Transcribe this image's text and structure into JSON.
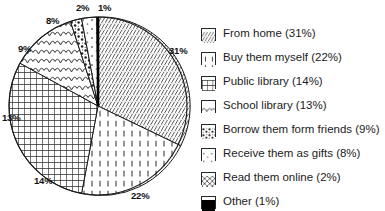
{
  "chart_data": {
    "type": "pie",
    "title": "",
    "xlabel": "",
    "ylabel": "",
    "legend_position": "right",
    "grid": false,
    "start_angle_deg": 0,
    "direction": "clockwise",
    "categories": [
      "From home",
      "Buy them myself",
      "Public library",
      "School library",
      "Borrow them form friends",
      "Receive them as gifts",
      "Read them online",
      "Other"
    ],
    "values": [
      31,
      22,
      14,
      13,
      9,
      8,
      2,
      1
    ],
    "value_unit": "%",
    "slices": [
      {
        "label": "From home",
        "value": 31,
        "data_label": "31%",
        "legend_text": "From home (31%)",
        "pattern": "diagonal-hatch",
        "start_deg": 0,
        "end_deg": 111.6
      },
      {
        "label": "Buy them myself",
        "value": 22,
        "data_label": "22%",
        "legend_text": "Buy them myself (22%)",
        "pattern": "vertical-dashes",
        "start_deg": 111.6,
        "end_deg": 190.8
      },
      {
        "label": "Public library",
        "value": 14,
        "data_label": "14%",
        "legend_text": "Public library (14%)",
        "pattern": "dense-grid",
        "start_deg": 190.8,
        "end_deg": 241.2
      },
      {
        "label": "School library",
        "value": 13,
        "data_label": "13%",
        "legend_text": "School library (13%)",
        "pattern": "fish-scales",
        "start_deg": 241.2,
        "end_deg": 288.0
      },
      {
        "label": "Borrow them form friends",
        "value": 9,
        "data_label": "9%",
        "legend_text": "Borrow them form friends (9%)",
        "pattern": "dense-speckle",
        "start_deg": 288.0,
        "end_deg": 320.4
      },
      {
        "label": "Receive them as gifts",
        "value": 8,
        "data_label": "8%",
        "legend_text": "Receive them as gifts (8%)",
        "pattern": "sparse-dots",
        "start_deg": 320.4,
        "end_deg": 349.2
      },
      {
        "label": "Read them online",
        "value": 2,
        "data_label": "2%",
        "legend_text": "Read them online (2%)",
        "pattern": "diagonal-cross",
        "start_deg": 349.2,
        "end_deg": 356.4
      },
      {
        "label": "Other",
        "value": 1,
        "data_label": "1%",
        "legend_text": "Other (1%)",
        "pattern": "solid-black",
        "start_deg": 356.4,
        "end_deg": 360.0
      }
    ],
    "colors": {
      "outline": "#1a1a1a",
      "fill": "#ffffff",
      "solid_slice": "#000000",
      "text": "#1a1a1a",
      "background": "#ffffff"
    }
  },
  "pie_labels": [
    {
      "text": "2%",
      "x": 76,
      "y": 3
    },
    {
      "text": "1%",
      "x": 98,
      "y": 3
    },
    {
      "text": "8%",
      "x": 46,
      "y": 16
    },
    {
      "text": "9%",
      "x": 18,
      "y": 44
    },
    {
      "text": "13%",
      "x": 2,
      "y": 113
    },
    {
      "text": "14%",
      "x": 34,
      "y": 176
    },
    {
      "text": "22%",
      "x": 131,
      "y": 191
    },
    {
      "text": "31%",
      "x": 169,
      "y": 46
    }
  ],
  "legend": {
    "items": [
      {
        "pattern": "diagonal-hatch",
        "text": "From home (31%)"
      },
      {
        "pattern": "vertical-dashes",
        "text": "Buy them myself (22%)"
      },
      {
        "pattern": "dense-grid",
        "text": "Public library (14%)"
      },
      {
        "pattern": "fish-scales",
        "text": "School library (13%)"
      },
      {
        "pattern": "dense-speckle",
        "text": "Borrow them form friends (9%)"
      },
      {
        "pattern": "sparse-dots",
        "text": "Receive them as gifts (8%)"
      },
      {
        "pattern": "diagonal-cross",
        "text": "Read them online (2%)"
      },
      {
        "pattern": "solid-black",
        "text": "Other (1%)"
      }
    ]
  }
}
